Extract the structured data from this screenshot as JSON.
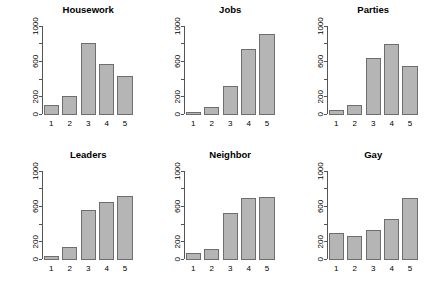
{
  "figure": {
    "background": "#ffffff",
    "bar_fill": "#b5b5b5",
    "bar_border": "#6e6e6e",
    "axis_color": "#555555",
    "layout": "2 rows x 3 columns of bar chart panels"
  },
  "chart_data": [
    {
      "type": "bar",
      "title": "Housework",
      "categories": [
        "1",
        "2",
        "3",
        "4",
        "5"
      ],
      "values": [
        95,
        200,
        800,
        560,
        425
      ],
      "xlabel": "",
      "ylabel": "",
      "ylim": [
        0,
        1000
      ],
      "yticks": [
        0,
        200,
        400,
        600,
        800,
        1000
      ],
      "ytick_labels": [
        "0",
        "200",
        "",
        "600",
        "",
        "1000"
      ],
      "grid": false,
      "legend": "none"
    },
    {
      "type": "bar",
      "title": "Jobs",
      "categories": [
        "1",
        "2",
        "3",
        "4",
        "5"
      ],
      "values": [
        25,
        80,
        320,
        740,
        910
      ],
      "xlabel": "",
      "ylabel": "",
      "ylim": [
        0,
        1000
      ],
      "yticks": [
        0,
        200,
        400,
        600,
        800,
        1000
      ],
      "ytick_labels": [
        "0",
        "200",
        "",
        "600",
        "",
        "1000"
      ],
      "grid": false,
      "legend": "none"
    },
    {
      "type": "bar",
      "title": "Parties",
      "categories": [
        "1",
        "2",
        "3",
        "4",
        "5"
      ],
      "values": [
        40,
        105,
        635,
        790,
        545
      ],
      "xlabel": "",
      "ylabel": "",
      "ylim": [
        0,
        1000
      ],
      "yticks": [
        0,
        200,
        400,
        600,
        800,
        1000
      ],
      "ytick_labels": [
        "0",
        "200",
        "",
        "600",
        "",
        "1000"
      ],
      "grid": false,
      "legend": "none"
    },
    {
      "type": "bar",
      "title": "Leaders",
      "categories": [
        "1",
        "2",
        "3",
        "4",
        "5"
      ],
      "values": [
        30,
        130,
        555,
        645,
        710
      ],
      "xlabel": "",
      "ylabel": "",
      "ylim": [
        0,
        1000
      ],
      "yticks": [
        0,
        200,
        400,
        600,
        800,
        1000
      ],
      "ytick_labels": [
        "0",
        "200",
        "",
        "600",
        "",
        "1000"
      ],
      "grid": false,
      "legend": "none"
    },
    {
      "type": "bar",
      "title": "Neighbor",
      "categories": [
        "1",
        "2",
        "3",
        "4",
        "5"
      ],
      "values": [
        65,
        110,
        520,
        690,
        700
      ],
      "xlabel": "",
      "ylabel": "",
      "ylim": [
        0,
        1000
      ],
      "yticks": [
        0,
        200,
        400,
        600,
        800,
        1000
      ],
      "ytick_labels": [
        "0",
        "200",
        "",
        "600",
        "",
        "1000"
      ],
      "grid": false,
      "legend": "none"
    },
    {
      "type": "bar",
      "title": "Gay",
      "categories": [
        "1",
        "2",
        "3",
        "4",
        "5"
      ],
      "values": [
        290,
        255,
        330,
        450,
        690
      ],
      "xlabel": "",
      "ylabel": "",
      "ylim": [
        0,
        1000
      ],
      "yticks": [
        0,
        200,
        400,
        600,
        800,
        1000
      ],
      "ytick_labels": [
        "0",
        "200",
        "",
        "600",
        "",
        "1000"
      ],
      "grid": false,
      "legend": "none"
    }
  ]
}
